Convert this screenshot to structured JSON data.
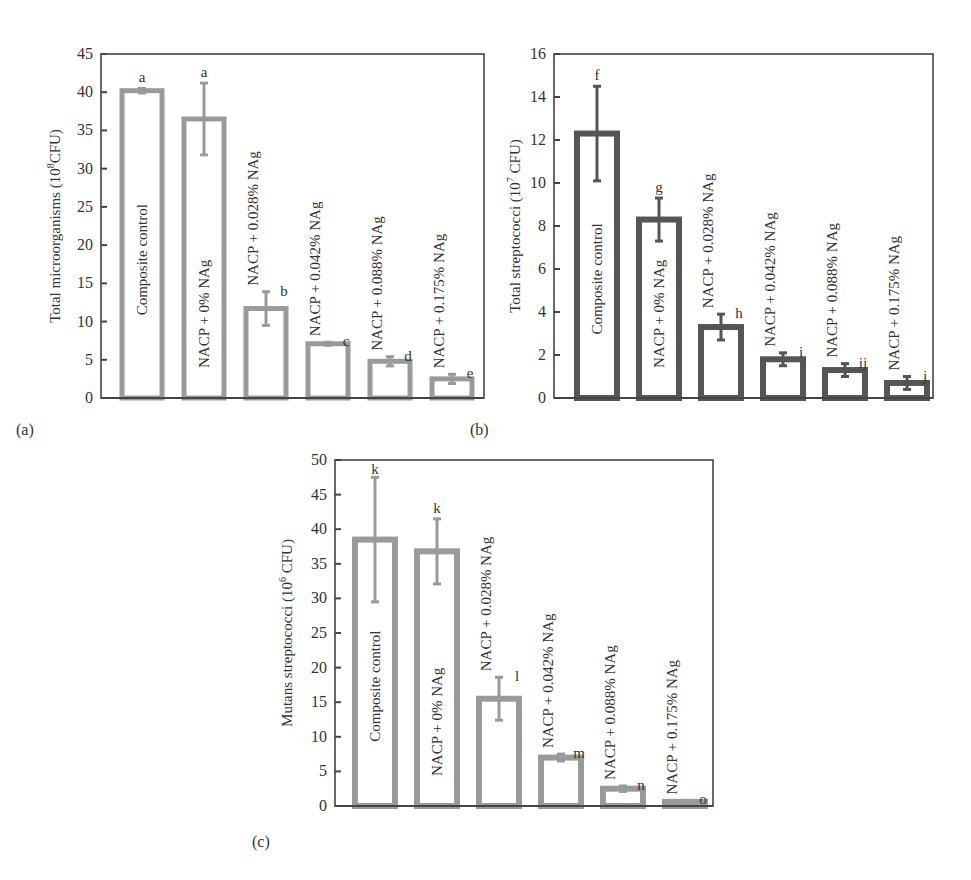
{
  "chart_data": [
    {
      "panel_label": "(a)",
      "type": "bar",
      "ylabel": "Total microorganisms (10^8 CFU)",
      "ylabel_base": "Total microorganisms (10",
      "ylabel_exp": "8",
      "ylabel_tail": "CFU)",
      "ylim": [
        0,
        45
      ],
      "yticks": [
        0,
        5,
        10,
        15,
        20,
        25,
        30,
        35,
        40,
        45
      ],
      "bar_color": "#9a9a9a",
      "categories": [
        "Composite control",
        "NACP + 0% NAg",
        "NACP + 0.028% NAg",
        "NACP + 0.042% NAg",
        "NACP + 0.088% NAg",
        "NACP + 0.175% NAg"
      ],
      "values": [
        40.2,
        36.5,
        11.7,
        7.1,
        4.8,
        2.5
      ],
      "errors": [
        0.3,
        4.7,
        2.2,
        0.2,
        0.6,
        0.6
      ],
      "significance_letters": [
        "a",
        "a",
        "b",
        "c",
        "d",
        "e"
      ]
    },
    {
      "panel_label": "(b)",
      "type": "bar",
      "ylabel": "Total streptococci (10^7 CFU)",
      "ylabel_base": "Total streptococci (10",
      "ylabel_exp": "7",
      "ylabel_tail": " CFU)",
      "ylim": [
        0,
        16
      ],
      "yticks": [
        0,
        2,
        4,
        6,
        8,
        10,
        12,
        14,
        16
      ],
      "bar_color": "#555555",
      "categories": [
        "Composite control",
        "NACP + 0% NAg",
        "NACP + 0.028% NAg",
        "NACP + 0.042% NAg",
        "NACP + 0.088% NAg",
        "NACP + 0.175% NAg"
      ],
      "values": [
        12.3,
        8.3,
        3.3,
        1.8,
        1.3,
        0.7
      ],
      "errors": [
        2.2,
        1.0,
        0.6,
        0.3,
        0.3,
        0.3
      ],
      "significance_letters": [
        "f",
        "g",
        "h",
        "i",
        "ij",
        "j"
      ]
    },
    {
      "panel_label": "(c)",
      "type": "bar",
      "ylabel": "Mutans streptococci (10^6 CFU)",
      "ylabel_base": "Mutans streptococci (10",
      "ylabel_exp": "6",
      "ylabel_tail": " CFU)",
      "ylim": [
        0,
        50
      ],
      "yticks": [
        0,
        5,
        10,
        15,
        20,
        25,
        30,
        35,
        40,
        45,
        50
      ],
      "bar_color": "#9a9a9a",
      "categories": [
        "Composite control",
        "NACP + 0% NAg",
        "NACP + 0.028% NAg",
        "NACP + 0.042% NAg",
        "NACP + 0.088% NAg",
        "NACP + 0.175% NAg"
      ],
      "values": [
        38.5,
        36.8,
        15.5,
        7.0,
        2.5,
        0.6
      ],
      "errors": [
        9.0,
        4.7,
        3.1,
        0.5,
        0.4,
        0.2
      ],
      "significance_letters": [
        "k",
        "k",
        "l",
        "m",
        "n",
        "o"
      ]
    }
  ]
}
